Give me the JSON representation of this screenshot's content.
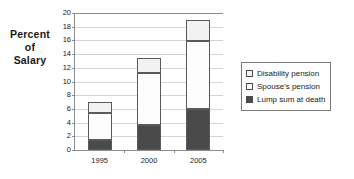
{
  "chart_data": {
    "type": "bar",
    "subtype": "stacked-bar",
    "title": "",
    "xlabel": "",
    "ylabel": "Percent of Salary",
    "ylabel_lines": [
      "Percent",
      "of",
      "Salary"
    ],
    "categories": [
      "1995",
      "2000",
      "2005"
    ],
    "ylim": [
      0,
      20
    ],
    "ytick_step": 2,
    "yticks": [
      "20",
      "18",
      "16",
      "14",
      "12",
      "10",
      "8",
      "6",
      "4",
      "2",
      "0"
    ],
    "grid": true,
    "legend_position": "right",
    "series": [
      {
        "name": "Disability pension",
        "values": [
          1.6,
          2.3,
          3.1
        ],
        "color": "#f2f2f2",
        "stack_order": 3
      },
      {
        "name": "Spouse's pension",
        "values": [
          3.9,
          7.5,
          9.9
        ],
        "color": "#fcfcfc",
        "stack_order": 2
      },
      {
        "name": "Lump sum at death",
        "values": [
          1.5,
          3.7,
          6.0
        ],
        "color": "#4a4a4a",
        "stack_order": 1
      }
    ],
    "stack_boundaries": {
      "1995": [
        0,
        1.5,
        5.4,
        7.0
      ],
      "2000": [
        0,
        3.7,
        11.2,
        13.5
      ],
      "2005": [
        0,
        6.0,
        15.9,
        19.0
      ]
    },
    "totals": [
      7.0,
      13.5,
      19.0
    ]
  },
  "legend": {
    "items": [
      {
        "label": "Disability pension",
        "swatch": "#f2f2f2"
      },
      {
        "label": "Spouse's pension",
        "swatch": "#fcfcfc"
      },
      {
        "label": "Lump sum at death",
        "swatch": "#4a4a4a"
      }
    ]
  }
}
